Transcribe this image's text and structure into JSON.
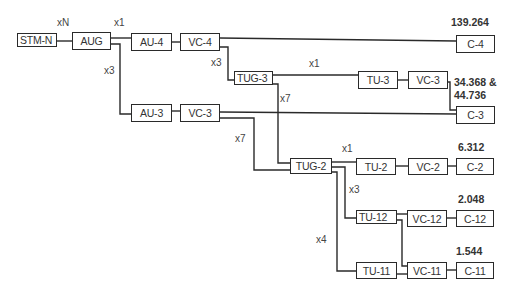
{
  "nodes": {
    "stm_n": "STM-N",
    "aug": "AUG",
    "au4": "AU-4",
    "vc4": "VC-4",
    "c4": "C-4",
    "tug3": "TUG-3",
    "tu3": "TU-3",
    "vc3_top": "VC-3",
    "au3": "AU-3",
    "vc3_bottom": "VC-3",
    "c3": "C-3",
    "tug2": "TUG-2",
    "tu2": "TU-2",
    "vc2": "VC-2",
    "c2": "C-2",
    "tu12": "TU-12",
    "vc12": "VC-12",
    "c12": "C-12",
    "tu11": "TU-11",
    "vc11": "VC-11",
    "c11": "C-11"
  },
  "multipliers": {
    "stm_aug": "xN",
    "aug_au4": "x1",
    "aug_au3": "x3",
    "vc4_tug3": "x3",
    "tug3_tu3": "x1",
    "tug3_tug2": "x7",
    "vc3_tug2": "x7",
    "tug2_tu2": "x1",
    "tug2_tu12": "x3",
    "tug2_tu11": "x4"
  },
  "rates": {
    "c4": "139.264",
    "c3_line1": "34.368 &",
    "c3_line2": "44.736",
    "c2": "6.312",
    "c12": "2.048",
    "c11": "1.544"
  },
  "colors": {
    "line": "#2a2a2a",
    "text": "#333333",
    "background": "#ffffff"
  }
}
